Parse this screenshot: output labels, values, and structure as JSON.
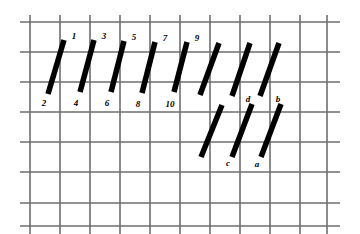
{
  "figure": {
    "name": "tilted-bars-on-grid-diagram",
    "background_color": "#ffffff",
    "width": 360,
    "height": 234
  },
  "grid": {
    "line_color": "#6e6e6e",
    "line_width": 1.6,
    "cell_size": 30,
    "x_start": 20,
    "y_start": 15,
    "vertical_lines_x": [
      30,
      60,
      90,
      120,
      150,
      180,
      210,
      240,
      270,
      300,
      327
    ],
    "horizontal_lines_y": [
      22,
      52,
      82,
      112,
      142,
      172,
      203,
      226
    ],
    "vertical_extent": [
      15,
      234
    ],
    "horizontal_extent": [
      20,
      340
    ]
  },
  "bars": {
    "color": "#000000",
    "stroke_width": 5.5,
    "top_row": [
      {
        "id": "bar-1-2",
        "top_label": "1",
        "bottom_label": "2",
        "x1": 64,
        "y1": 40,
        "x2": 48,
        "y2": 94
      },
      {
        "id": "bar-3-4",
        "top_label": "3",
        "bottom_label": "4",
        "x1": 94,
        "y1": 40,
        "x2": 80,
        "y2": 92
      },
      {
        "id": "bar-5-6",
        "top_label": "5",
        "bottom_label": "6",
        "x1": 124,
        "y1": 41,
        "x2": 111,
        "y2": 92
      },
      {
        "id": "bar-7-8",
        "top_label": "7",
        "bottom_label": "8",
        "x1": 155,
        "y1": 42,
        "x2": 142,
        "y2": 93
      },
      {
        "id": "bar-9-10",
        "top_label": "9",
        "bottom_label": "10",
        "x1": 187,
        "y1": 42,
        "x2": 174,
        "y2": 92
      },
      {
        "id": "bar-top-6",
        "top_label": "",
        "bottom_label": "",
        "x1": 219,
        "y1": 43,
        "x2": 200,
        "y2": 95
      },
      {
        "id": "bar-top-7",
        "top_label": "",
        "bottom_label": "",
        "x1": 250,
        "y1": 43,
        "x2": 232,
        "y2": 96
      },
      {
        "id": "bar-top-8",
        "top_label": "",
        "bottom_label": "",
        "x1": 279,
        "y1": 43,
        "x2": 260,
        "y2": 96
      }
    ],
    "bottom_row": [
      {
        "id": "bar-bot-1",
        "top_label": "",
        "bottom_label": "",
        "x1": 222,
        "y1": 105,
        "x2": 201,
        "y2": 157
      },
      {
        "id": "bar-d-c",
        "top_label": "d",
        "bottom_label": "c",
        "x1": 252,
        "y1": 104,
        "x2": 232,
        "y2": 157
      },
      {
        "id": "bar-b-a",
        "top_label": "b",
        "bottom_label": "a",
        "x1": 281,
        "y1": 104,
        "x2": 261,
        "y2": 157
      }
    ]
  },
  "labels": [
    {
      "name": "label-1",
      "text": "1",
      "x": 74,
      "y": 36
    },
    {
      "name": "label-3",
      "text": "3",
      "x": 104,
      "y": 36
    },
    {
      "name": "label-5",
      "text": "5",
      "x": 134,
      "y": 37
    },
    {
      "name": "label-7",
      "text": "7",
      "x": 165,
      "y": 38
    },
    {
      "name": "label-9",
      "text": "9",
      "x": 197,
      "y": 38
    },
    {
      "name": "label-2",
      "text": "2",
      "x": 44,
      "y": 103
    },
    {
      "name": "label-4",
      "text": "4",
      "x": 76,
      "y": 103
    },
    {
      "name": "label-6",
      "text": "6",
      "x": 107,
      "y": 103
    },
    {
      "name": "label-8",
      "text": "8",
      "x": 138,
      "y": 104
    },
    {
      "name": "label-10",
      "text": "10",
      "x": 170,
      "y": 104
    },
    {
      "name": "label-d",
      "text": "d",
      "x": 248,
      "y": 99
    },
    {
      "name": "label-b",
      "text": "b",
      "x": 278,
      "y": 99
    },
    {
      "name": "label-c",
      "text": "c",
      "x": 228,
      "y": 163
    },
    {
      "name": "label-a",
      "text": "a",
      "x": 257,
      "y": 164
    }
  ]
}
